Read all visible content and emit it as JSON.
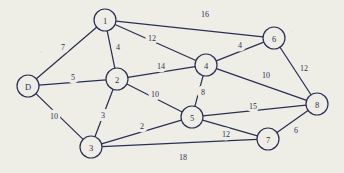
{
  "figure": {
    "kind": "weighted-undirected-graph",
    "background_color": "#efeee6",
    "ink_color": "#2a2f56",
    "width": 344,
    "height": 173
  },
  "chart_data": {
    "type": "diagram",
    "title": "",
    "xlabel": "",
    "ylabel": "",
    "grid": false,
    "legend": null,
    "nodes": [
      {
        "id": "D",
        "label": "D",
        "x": 28,
        "y": 86,
        "r": 11
      },
      {
        "id": "1",
        "label": "1",
        "x": 105,
        "y": 20,
        "r": 11
      },
      {
        "id": "2",
        "label": "2",
        "x": 117,
        "y": 79,
        "r": 11
      },
      {
        "id": "3",
        "label": "3",
        "x": 91,
        "y": 147,
        "r": 11
      },
      {
        "id": "4",
        "label": "4",
        "x": 206,
        "y": 65,
        "r": 11
      },
      {
        "id": "5",
        "label": "5",
        "x": 192,
        "y": 117,
        "r": 11
      },
      {
        "id": "6",
        "label": "6",
        "x": 274,
        "y": 38,
        "r": 11
      },
      {
        "id": "7",
        "label": "7",
        "x": 268,
        "y": 139,
        "r": 11
      },
      {
        "id": "8",
        "label": "8",
        "x": 317,
        "y": 104,
        "r": 11
      }
    ],
    "edges": [
      {
        "source": "D",
        "target": "1",
        "weight": 7,
        "label_x": 63,
        "label_y": 47
      },
      {
        "source": "D",
        "target": "2",
        "weight": 5,
        "label_x": 73,
        "label_y": 77
      },
      {
        "source": "D",
        "target": "3",
        "weight": 10,
        "label_x": 54,
        "label_y": 116
      },
      {
        "source": "1",
        "target": "2",
        "weight": 4,
        "label_x": 118,
        "label_y": 47
      },
      {
        "source": "1",
        "target": "4",
        "weight": 12,
        "label_x": 152,
        "label_y": 38
      },
      {
        "source": "1",
        "target": "6",
        "weight": 16,
        "label_x": 205,
        "label_y": 14
      },
      {
        "source": "2",
        "target": "3",
        "weight": 3,
        "label_x": 103,
        "label_y": 115
      },
      {
        "source": "2",
        "target": "4",
        "weight": 14,
        "label_x": 161,
        "label_y": 66
      },
      {
        "source": "2",
        "target": "5",
        "weight": 10,
        "label_x": 155,
        "label_y": 94
      },
      {
        "source": "3",
        "target": "5",
        "weight": 2,
        "label_x": 142,
        "label_y": 126
      },
      {
        "source": "3",
        "target": "7",
        "weight": 18,
        "label_x": 183,
        "label_y": 157
      },
      {
        "source": "4",
        "target": "5",
        "weight": 8,
        "label_x": 203,
        "label_y": 92
      },
      {
        "source": "4",
        "target": "6",
        "weight": 4,
        "label_x": 240,
        "label_y": 45
      },
      {
        "source": "4",
        "target": "8",
        "weight": 10,
        "label_x": 266,
        "label_y": 75
      },
      {
        "source": "5",
        "target": "7",
        "weight": 12,
        "label_x": 226,
        "label_y": 134
      },
      {
        "source": "5",
        "target": "8",
        "weight": 15,
        "label_x": 253,
        "label_y": 106
      },
      {
        "source": "6",
        "target": "8",
        "weight": 12,
        "label_x": 304,
        "label_y": 68
      },
      {
        "source": "7",
        "target": "8",
        "weight": 6,
        "label_x": 296,
        "label_y": 130
      }
    ]
  }
}
